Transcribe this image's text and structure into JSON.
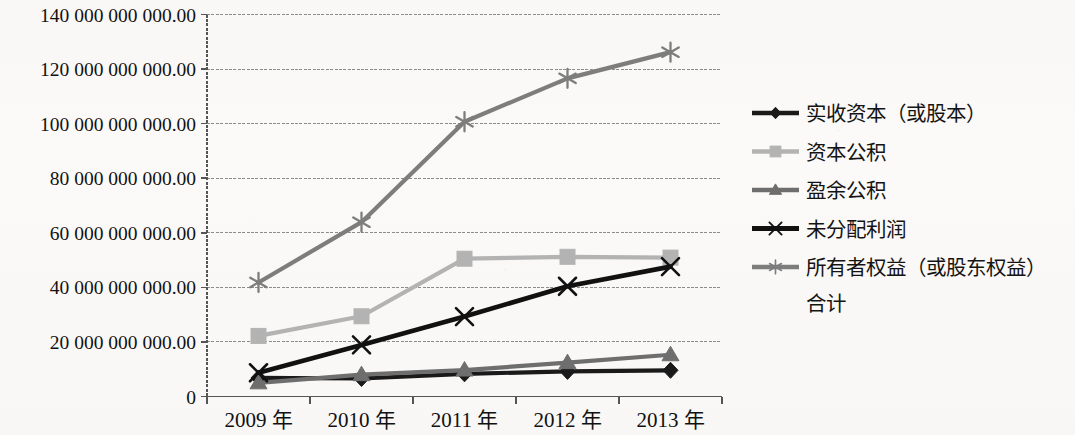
{
  "chart_data": {
    "type": "line",
    "title": "",
    "subtitle": "",
    "xlabel": "",
    "ylabel": "",
    "grid": true,
    "legend_position": "right",
    "categories": [
      "2009 年",
      "2010 年",
      "2011 年",
      "2012 年",
      "2013 年"
    ],
    "ylim": [
      0,
      140000000000
    ],
    "ytick_values": [
      0,
      20000000000,
      40000000000,
      60000000000,
      80000000000,
      100000000000,
      120000000000,
      140000000000
    ],
    "ytick_labels": [
      "0",
      "20 000 000 000.00",
      "40 000 000 000.00",
      "60 000 000 000.00",
      "80 000 000 000.00",
      "100 000 000 000.00",
      "120 000 000 000.00",
      "140 000 000 000.00"
    ],
    "series": [
      {
        "name": "实收资本（或股本）",
        "marker": "diamond",
        "color": "#1a1a1a",
        "values": [
          6800000000,
          6600000000,
          8300000000,
          9200000000,
          9600000000
        ]
      },
      {
        "name": "资本公积",
        "marker": "square",
        "color": "#b3b3b3",
        "values": [
          22200000000,
          29400000000,
          50500000000,
          51200000000,
          50900000000
        ]
      },
      {
        "name": "盈余公积",
        "marker": "triangle",
        "color": "#6e6e6e",
        "values": [
          5000000000,
          8000000000,
          9700000000,
          12400000000,
          15300000000
        ]
      },
      {
        "name": "未分配利润",
        "marker": "cross",
        "color": "#111111",
        "values": [
          8700000000,
          18900000000,
          29300000000,
          40400000000,
          47600000000
        ]
      },
      {
        "name": "所有者权益（或股东权益）合计",
        "marker": "asterisk",
        "color": "#7d7d7d",
        "values": [
          41800000000,
          63900000000,
          100700000000,
          116600000000,
          126200000000
        ]
      }
    ]
  },
  "legend": {
    "entries": [
      {
        "label": "实收资本（或股本）",
        "label_line2": ""
      },
      {
        "label": "资本公积",
        "label_line2": ""
      },
      {
        "label": "盈余公积",
        "label_line2": ""
      },
      {
        "label": "未分配利润",
        "label_line2": ""
      },
      {
        "label": "所有者权益（或股东权益）",
        "label_line2": "合计"
      }
    ]
  },
  "axis": {
    "y_axis_color": "#555555",
    "x_axis_color": "#555555",
    "gridline_color": "#8c8c8c"
  }
}
